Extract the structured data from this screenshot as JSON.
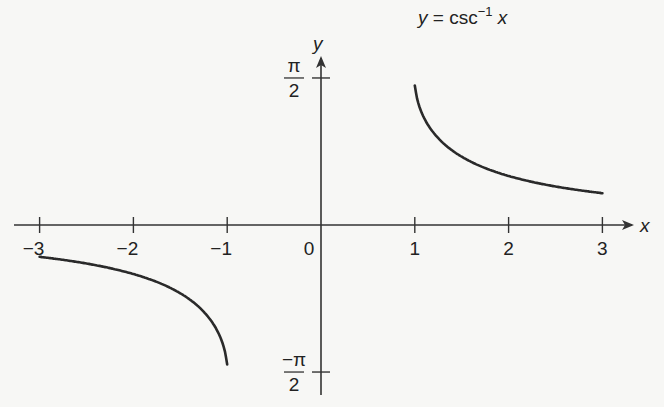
{
  "chart_data": {
    "type": "line",
    "title_parts": {
      "lhs": "y",
      "eq": " = csc",
      "sup": "−1",
      "rhs": " x"
    },
    "xlabel": "x",
    "ylabel": "y",
    "xlim": [
      -3.3,
      3.4
    ],
    "ylim": [
      -1.6,
      1.9
    ],
    "x_ticks": [
      {
        "value": -3,
        "label": "−3"
      },
      {
        "value": -2,
        "label": "−2"
      },
      {
        "value": -1,
        "label": "−1"
      },
      {
        "value": 0,
        "label": "0"
      },
      {
        "value": 1,
        "label": "1"
      },
      {
        "value": 2,
        "label": "2"
      },
      {
        "value": 3,
        "label": "3"
      }
    ],
    "y_ticks": [
      {
        "value": 1.5708,
        "label_num": "π",
        "label_den": "2"
      },
      {
        "value": -1.5708,
        "label_num": "−π",
        "label_den": "2"
      }
    ],
    "grid": false,
    "series": [
      {
        "name": "csc⁻¹ x (x ≥ 1)",
        "domain": [
          1,
          3
        ],
        "x": [
          1.0,
          1.05,
          1.1,
          1.2,
          1.4,
          1.6,
          1.8,
          2.0,
          2.25,
          2.5,
          2.75,
          3.0
        ],
        "y": [
          1.5708,
          1.261,
          1.1411,
          0.9851,
          0.7956,
          0.6751,
          0.589,
          0.5236,
          0.4611,
          0.4115,
          0.3709,
          0.3398
        ]
      },
      {
        "name": "csc⁻¹ x (x ≤ −1)",
        "domain": [
          -3,
          -1
        ],
        "x": [
          -3.0,
          -2.75,
          -2.5,
          -2.25,
          -2.0,
          -1.8,
          -1.6,
          -1.4,
          -1.2,
          -1.1,
          -1.05,
          -1.0
        ],
        "y": [
          -0.3398,
          -0.3709,
          -0.4115,
          -0.4611,
          -0.5236,
          -0.589,
          -0.6751,
          -0.7956,
          -0.9851,
          -1.1411,
          -1.261,
          -1.5708
        ]
      }
    ]
  },
  "colors": {
    "axis": "#333333",
    "curve": "#2a2a2a",
    "text": "#222222",
    "background": "#f7f7f5"
  }
}
